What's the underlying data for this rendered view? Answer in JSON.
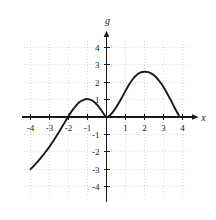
{
  "figure": {
    "background_color": "#ffffff",
    "curve_color": "#1a1a1a",
    "axis_color": "#1a1a1a",
    "grid_color": "#c8c8c8",
    "label_color": "#1a1a1a"
  },
  "chart_data": {
    "type": "line",
    "title": "",
    "xlabel": "x",
    "ylabel": "g",
    "xlim": [
      -4.4,
      4.6
    ],
    "ylim": [
      -4.6,
      4.6
    ],
    "grid": true,
    "grid_style": "dotted",
    "legend": null,
    "xticks": [
      -4,
      -3,
      -2,
      -1,
      1,
      2,
      3,
      4
    ],
    "yticks": [
      4,
      3,
      2,
      1,
      -1,
      -2,
      -3,
      -4
    ],
    "xtick_labels": [
      "-4",
      "-3",
      "-2",
      "-1",
      "1",
      "2",
      "3",
      "4"
    ],
    "ytick_labels": [
      "4",
      "3",
      "2",
      "1",
      "-1",
      "-2",
      "-3",
      "-4"
    ],
    "series": [
      {
        "name": "g",
        "x": [
          -4.0,
          -3.8,
          -3.6,
          -3.4,
          -3.2,
          -3.0,
          -2.8,
          -2.6,
          -2.4,
          -2.2,
          -2.0,
          -1.8,
          -1.6,
          -1.4,
          -1.2,
          -1.0,
          -0.8,
          -0.6,
          -0.4,
          -0.2,
          0.0,
          0.2,
          0.4,
          0.6,
          0.8,
          1.0,
          1.2,
          1.4,
          1.6,
          1.8,
          2.0,
          2.2,
          2.4,
          2.6,
          2.8,
          3.0,
          3.2,
          3.4,
          3.6,
          3.85
        ],
        "y": [
          -3.0,
          -2.78,
          -2.54,
          -2.28,
          -2.0,
          -1.7,
          -1.38,
          -1.04,
          -0.68,
          -0.31,
          0.05,
          0.38,
          0.66,
          0.87,
          0.99,
          1.03,
          0.97,
          0.82,
          0.58,
          0.27,
          0.0,
          0.12,
          0.38,
          0.72,
          1.1,
          1.5,
          1.88,
          2.2,
          2.43,
          2.56,
          2.6,
          2.58,
          2.48,
          2.3,
          2.04,
          1.72,
          1.34,
          0.94,
          0.5,
          0.0
        ]
      }
    ],
    "annotations": {
      "left_endpoint": {
        "x": -4.0,
        "y": -3.0
      },
      "local_maximum": {
        "x": -1.0,
        "y": 1.03
      },
      "local_minimum": {
        "x": 0.0,
        "y": 0.0
      },
      "global_maximum": {
        "x": 2.0,
        "y": 2.6
      },
      "right_endpoint": {
        "x": 3.85,
        "y": 0.0
      }
    }
  }
}
